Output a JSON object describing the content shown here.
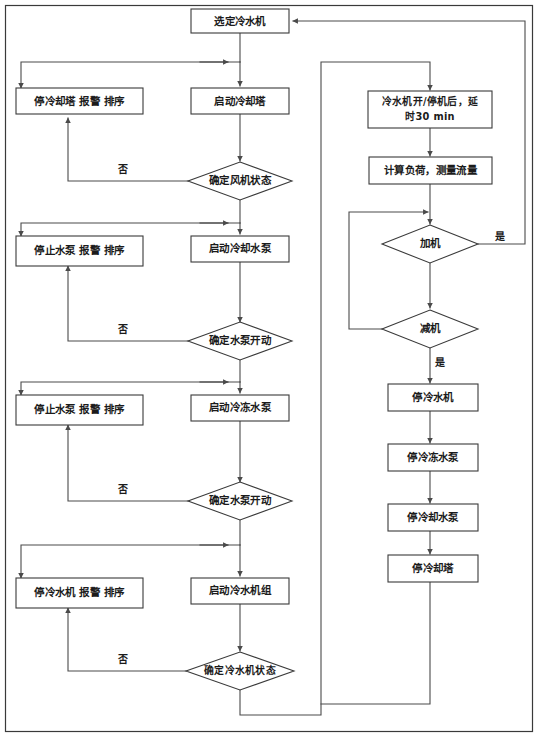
{
  "diagram": {
    "type": "flowchart",
    "orientation": "top-down",
    "colors": {
      "background": "#ffffff",
      "stroke": "#3a3a3a",
      "text": "#1b1b1b"
    },
    "nodes": {
      "start": {
        "label": "选定冷水机",
        "shape": "rect"
      },
      "stop_tower_alarm": {
        "label": "停冷却塔 报警 排序",
        "shape": "rect"
      },
      "start_tower": {
        "label": "启动冷却塔",
        "shape": "rect"
      },
      "check_fan": {
        "label": "确定风机状态",
        "shape": "diamond"
      },
      "stop_pump_alarm_1": {
        "label": "停止水泵 报警 排序",
        "shape": "rect"
      },
      "start_cooling_pump": {
        "label": "启动冷却水泵",
        "shape": "rect"
      },
      "check_pump_1": {
        "label": "确定水泵开动",
        "shape": "diamond"
      },
      "stop_pump_alarm_2": {
        "label": "停止水泵 报警 排序",
        "shape": "rect"
      },
      "start_chilled_pump": {
        "label": "启动冷冻水泵",
        "shape": "rect"
      },
      "check_pump_2": {
        "label": "确定水泵开动",
        "shape": "diamond"
      },
      "stop_chiller_alarm": {
        "label": "停冷水机 报警 排序",
        "shape": "rect"
      },
      "start_chiller_unit": {
        "label": "启动冷水机组",
        "shape": "rect"
      },
      "check_chiller": {
        "label": "确定冷水机状态",
        "shape": "diamond"
      },
      "delay": {
        "label_line1": "冷水机开/停机后，延",
        "label_line2": "时30 min",
        "shape": "rect"
      },
      "calc_load": {
        "label": "计算负荷，测量流量",
        "shape": "rect"
      },
      "add_machine": {
        "label": "加机",
        "shape": "diamond"
      },
      "reduce_machine": {
        "label": "减机",
        "shape": "diamond"
      },
      "stop_chiller": {
        "label": "停冷水机",
        "shape": "rect"
      },
      "stop_chilled_pump": {
        "label": "停冷冻水泵",
        "shape": "rect"
      },
      "stop_cooling_pump": {
        "label": "停冷却水泵",
        "shape": "rect"
      },
      "stop_tower": {
        "label": "停冷却塔",
        "shape": "rect"
      }
    },
    "edge_labels": {
      "no_fan": "否",
      "no_pump_1": "否",
      "no_pump_2": "否",
      "no_chiller": "否",
      "yes_add": "是",
      "yes_reduce": "是"
    }
  }
}
